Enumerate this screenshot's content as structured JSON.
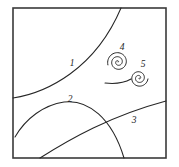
{
  "figure": {
    "background_color": "#ffffff",
    "stroke_color": "#262626",
    "frame_color": "#3a3a3a",
    "label_color": "#1d1d1d",
    "width": 179,
    "height": 167,
    "frame": {
      "x": 13,
      "y": 8,
      "width": 153,
      "height": 150
    },
    "labels": [
      {
        "id": "1",
        "text": "1",
        "x": 72,
        "y": 64
      },
      {
        "id": "2",
        "text": "2",
        "x": 70,
        "y": 100
      },
      {
        "id": "3",
        "text": "3",
        "x": 134,
        "y": 121
      },
      {
        "id": "4",
        "text": "4",
        "x": 122,
        "y": 48
      },
      {
        "id": "5",
        "text": "5",
        "x": 143,
        "y": 65
      }
    ],
    "curves": [
      {
        "id": "1",
        "name": "separatrix-curve-1",
        "description": "concave arc descending from top edge to left edge",
        "path": "M 121 8 C 110 34, 92 58, 70 74 C 52 87, 33 95, 13 98"
      },
      {
        "id": "2",
        "name": "dome-curve-2",
        "description": "dome shaped arc rising from lower-left to peak then down to bottom edge",
        "path": "M 15 137 C 26 118, 44 105, 64 102 C 88 99, 112 118, 124 158"
      },
      {
        "id": "3",
        "name": "rising-line-curve-3",
        "description": "gently rising line from bottom-left to right edge",
        "path": "M 40 158 C 70 139, 110 116, 166 101"
      }
    ],
    "spirals": [
      {
        "id": "4",
        "name": "spiral-focus-4",
        "center_x": 118,
        "center_y": 62,
        "turns": 2.6,
        "max_radius": 10.5,
        "direction": "counterclockwise",
        "start_angle_deg": 20
      },
      {
        "id": "5",
        "name": "spiral-focus-5",
        "center_x": 139,
        "center_y": 78,
        "turns": 2.4,
        "max_radius": 9.0,
        "direction": "counterclockwise",
        "start_angle_deg": 150
      }
    ],
    "connector": {
      "name": "spiral-connector-tail",
      "description": "short tail joining the lower spiral toward the left",
      "path": "M 105 83 C 114 84, 124 83, 131 79"
    }
  }
}
